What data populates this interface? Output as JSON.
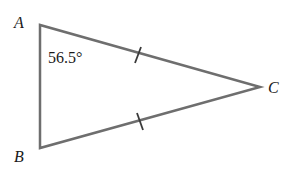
{
  "diagram": {
    "type": "isosceles-triangle",
    "stroke_color": "#6e6e6e",
    "text_color": "#1a1a1a",
    "vertices": [
      {
        "name": "A",
        "x": 40,
        "y": 25,
        "label_x": 14,
        "label_y": 28
      },
      {
        "name": "B",
        "x": 40,
        "y": 148,
        "label_x": 14,
        "label_y": 162
      },
      {
        "name": "C",
        "x": 260,
        "y": 87,
        "label_x": 268,
        "label_y": 93
      }
    ],
    "angle_label": {
      "vertex": "A",
      "text": "56.5°"
    },
    "congruent_sides": [
      "AC",
      "BC"
    ],
    "tick_marks": [
      {
        "side": "AC",
        "count": 1
      },
      {
        "side": "BC",
        "count": 1
      }
    ]
  }
}
